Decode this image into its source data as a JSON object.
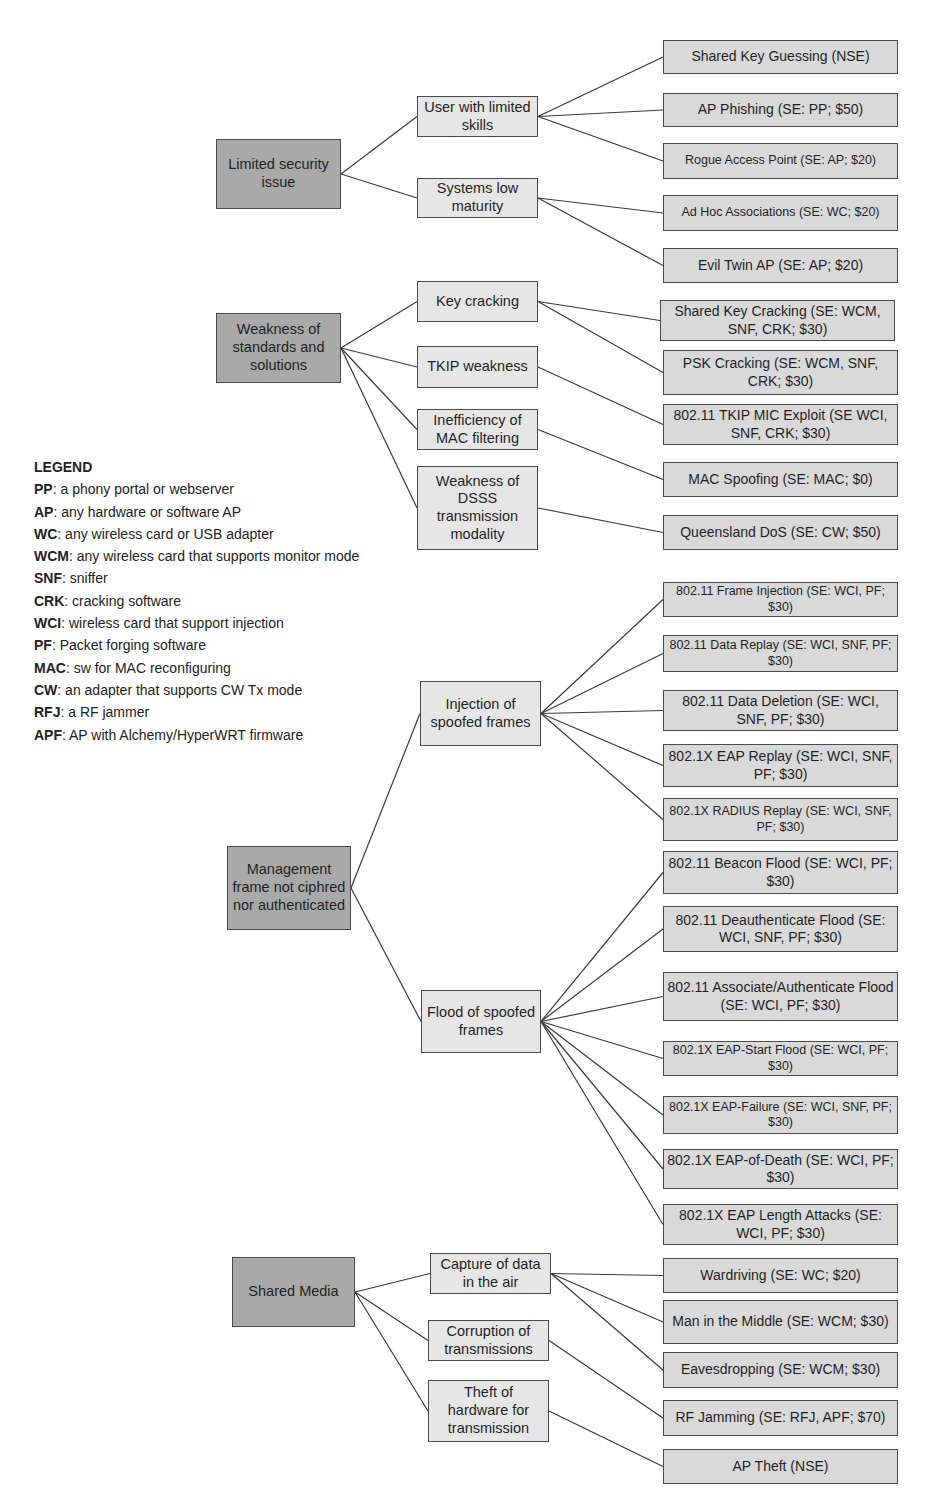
{
  "diagram": {
    "type": "attack-tree",
    "roots": [
      {
        "id": "r1",
        "label": "Limited security issue",
        "box": [
          216,
          139,
          125,
          70
        ]
      },
      {
        "id": "r2",
        "label": "Weakness of standards and solutions",
        "box": [
          216,
          313,
          125,
          70
        ]
      },
      {
        "id": "r3",
        "label": "Management frame not ciphred nor authenticated",
        "box": [
          227,
          846,
          124,
          84
        ]
      },
      {
        "id": "r4",
        "label": "Shared Media",
        "box": [
          232,
          1257,
          123,
          70
        ]
      }
    ],
    "mids": [
      {
        "id": "m1",
        "parent": "r1",
        "label": "User with limited skills",
        "box": [
          417,
          96,
          121,
          41
        ]
      },
      {
        "id": "m2",
        "parent": "r1",
        "label": "Systems low maturity",
        "box": [
          417,
          178,
          121,
          40
        ]
      },
      {
        "id": "m3",
        "parent": "r2",
        "label": "Key cracking",
        "box": [
          417,
          281,
          121,
          41
        ]
      },
      {
        "id": "m4",
        "parent": "r2",
        "label": "TKIP weakness",
        "box": [
          417,
          346,
          121,
          42
        ]
      },
      {
        "id": "m5",
        "parent": "r2",
        "label": "Inefficiency of MAC filtering",
        "box": [
          417,
          409,
          121,
          41
        ]
      },
      {
        "id": "m6",
        "parent": "r2",
        "label": "Weakness of DSSS transmission modality",
        "box": [
          417,
          466,
          121,
          84
        ]
      },
      {
        "id": "m7",
        "parent": "r3",
        "label": "Injection of spoofed frames",
        "box": [
          420,
          681,
          121,
          65
        ]
      },
      {
        "id": "m8",
        "parent": "r3",
        "label": "Flood of spoofed frames",
        "box": [
          421,
          990,
          120,
          63
        ]
      },
      {
        "id": "m9",
        "parent": "r4",
        "label": "Capture of data in the air",
        "box": [
          430,
          1253,
          121,
          41
        ]
      },
      {
        "id": "m10",
        "parent": "r4",
        "label": "Corruption of transmissions",
        "box": [
          428,
          1320,
          121,
          41
        ]
      },
      {
        "id": "m11",
        "parent": "r4",
        "label": "Theft of hardware for transmission",
        "box": [
          428,
          1380,
          121,
          62
        ]
      }
    ],
    "leaves": [
      {
        "parent": "m1",
        "label": "Shared Key Guessing (NSE)",
        "box": [
          663,
          40,
          235,
          34
        ],
        "small": false
      },
      {
        "parent": "m1",
        "label": "AP Phishing (SE: PP; $50)",
        "box": [
          663,
          93,
          235,
          34
        ],
        "small": false
      },
      {
        "parent": "m1",
        "label": "Rogue Access Point (SE: AP; $20)",
        "box": [
          663,
          143,
          235,
          36
        ],
        "small": true
      },
      {
        "parent": "m2",
        "label": "Ad Hoc Associations (SE: WC; $20)",
        "box": [
          663,
          195,
          235,
          36
        ],
        "small": true
      },
      {
        "parent": "m2",
        "label": "Evil Twin AP (SE: AP; $20)",
        "box": [
          663,
          248,
          235,
          35
        ],
        "small": false
      },
      {
        "parent": "m3",
        "label": "Shared Key Cracking (SE: WCM, SNF, CRK; $30)",
        "box": [
          660,
          300,
          235,
          41
        ],
        "small": false
      },
      {
        "parent": "m3",
        "label": "PSK Cracking (SE: WCM, SNF, CRK; $30)",
        "box": [
          663,
          350,
          235,
          45
        ],
        "small": false
      },
      {
        "parent": "m4",
        "label": "802.11 TKIP MIC Exploit (SE WCI, SNF, CRK; $30)",
        "box": [
          663,
          404,
          235,
          41
        ],
        "small": false
      },
      {
        "parent": "m5",
        "label": "MAC Spoofing (SE: MAC; $0)",
        "box": [
          663,
          462,
          235,
          35
        ],
        "small": false
      },
      {
        "parent": "m6",
        "label": "Queensland DoS (SE: CW; $50)",
        "box": [
          663,
          515,
          235,
          35
        ],
        "small": false
      },
      {
        "parent": "m7",
        "label": "802.11 Frame Injection (SE: WCI, PF; $30)",
        "box": [
          663,
          582,
          235,
          35
        ],
        "small": true
      },
      {
        "parent": "m7",
        "label": "802.11 Data Replay (SE: WCI, SNF, PF; $30)",
        "box": [
          663,
          635,
          235,
          37
        ],
        "small": true
      },
      {
        "parent": "m7",
        "label": "802.11 Data Deletion (SE: WCI, SNF, PF; $30)",
        "box": [
          663,
          690,
          235,
          41
        ],
        "small": false
      },
      {
        "parent": "m7",
        "label": "802.1X EAP Replay (SE: WCI, SNF, PF; $30)",
        "box": [
          663,
          744,
          235,
          43
        ],
        "small": false
      },
      {
        "parent": "m7",
        "label": "802.1X RADIUS Replay (SE: WCI, SNF, PF; $30)",
        "box": [
          663,
          798,
          235,
          43
        ],
        "small": true
      },
      {
        "parent": "m8",
        "label": "802.11 Beacon Flood (SE: WCI, PF; $30)",
        "box": [
          663,
          851,
          235,
          43
        ],
        "small": false
      },
      {
        "parent": "m8",
        "label": "802.11 Deauthenticate Flood (SE: WCI, SNF, PF; $30)",
        "box": [
          663,
          906,
          235,
          46
        ],
        "small": false
      },
      {
        "parent": "m8",
        "label": "802.11 Associate/Authenticate Flood (SE: WCI, PF; $30)",
        "box": [
          663,
          972,
          235,
          49
        ],
        "small": false
      },
      {
        "parent": "m8",
        "label": "802.1X EAP-Start Flood (SE: WCI, PF; $30)",
        "box": [
          663,
          1041,
          235,
          35
        ],
        "small": true
      },
      {
        "parent": "m8",
        "label": "802.1X EAP-Failure (SE: WCI, SNF, PF; $30)",
        "box": [
          663,
          1096,
          235,
          38
        ],
        "small": true
      },
      {
        "parent": "m8",
        "label": "802.1X EAP-of-Death (SE: WCI, PF; $30)",
        "box": [
          663,
          1149,
          235,
          40
        ],
        "small": false
      },
      {
        "parent": "m8",
        "label": "802.1X EAP Length Attacks (SE: WCI, PF; $30)",
        "box": [
          663,
          1204,
          235,
          41
        ],
        "small": false
      },
      {
        "parent": "m9",
        "label": "Wardriving (SE: WC; $20)",
        "box": [
          663,
          1258,
          235,
          35
        ],
        "small": false
      },
      {
        "parent": "m9",
        "label": "Man in the Middle (SE: WCM; $30)",
        "box": [
          663,
          1300,
          235,
          44
        ],
        "small": false
      },
      {
        "parent": "m9",
        "label": "Eavesdropping (SE: WCM; $30)",
        "box": [
          663,
          1352,
          235,
          36
        ],
        "small": false
      },
      {
        "parent": "m10",
        "label": "RF Jamming (SE: RFJ, APF; $70)",
        "box": [
          663,
          1400,
          235,
          36
        ],
        "small": false
      },
      {
        "parent": "m11",
        "label": "AP Theft (NSE)",
        "box": [
          663,
          1449,
          235,
          35
        ],
        "small": false
      }
    ]
  },
  "legend": {
    "title": "LEGEND",
    "items": [
      {
        "key": "PP",
        "desc": ": a phony portal or webserver"
      },
      {
        "key": "AP",
        "desc": ": any hardware or software AP"
      },
      {
        "key": "WC",
        "desc": ": any wireless card or USB adapter"
      },
      {
        "key": "WCM",
        "desc": ": any wireless card that supports monitor mode"
      },
      {
        "key": "SNF",
        "desc": ": sniffer"
      },
      {
        "key": "CRK",
        "desc": ": cracking software"
      },
      {
        "key": "WCI",
        "desc": ": wireless card that support injection"
      },
      {
        "key": "PF",
        "desc": ": Packet forging software"
      },
      {
        "key": "MAC",
        "desc": ": sw for MAC reconfiguring"
      },
      {
        "key": "CW",
        "desc": ": an adapter that supports CW Tx mode"
      },
      {
        "key": "RFJ",
        "desc": ": a RF jammer"
      },
      {
        "key": "APF",
        "desc": ": AP with Alchemy/HyperWRT firmware"
      }
    ]
  },
  "colors": {
    "root_fill": "#a9a9a9",
    "mid_fill": "#e6e6e6",
    "leaf_fill": "#d9d9d9",
    "border": "#4a4a4a",
    "edge": "#3a3a3a"
  }
}
